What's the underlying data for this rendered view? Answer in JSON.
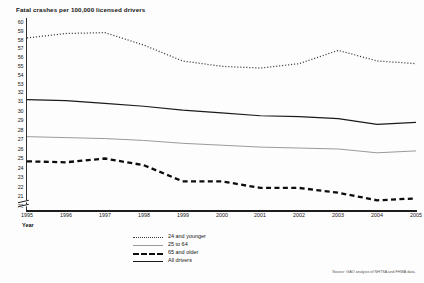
{
  "chart_data": {
    "type": "line",
    "title": "Fatal crashes per 100,000 licensed drivers",
    "xlabel": "Year",
    "ylabel": "",
    "grid": false,
    "legend_position": "bottom-center",
    "axis_note": "broken y-axis: lower band 20-32, upper band 53-60",
    "categories": [
      "1995",
      "1996",
      "1997",
      "1998",
      "1999",
      "2000",
      "2001",
      "2002",
      "2003",
      "2004",
      "2005"
    ],
    "x": [
      1995,
      1996,
      1997,
      1998,
      1999,
      2000,
      2001,
      2002,
      2003,
      2004,
      2005
    ],
    "ylim_lower": [
      20,
      32
    ],
    "ylim_upper": [
      53,
      60
    ],
    "yticks_lower": [
      "32",
      "31",
      "30",
      "29",
      "28",
      "27",
      "26",
      "25",
      "24",
      "23",
      "22",
      "21",
      "20"
    ],
    "yticks_upper": [
      "60",
      "59",
      "58",
      "57",
      "56",
      "55",
      "54",
      "53"
    ],
    "series": [
      {
        "name": "24 and younger",
        "style": "dotted",
        "color": "#3a3a3a",
        "values": [
          58.2,
          58.7,
          58.8,
          57.4,
          55.6,
          55.0,
          54.8,
          55.3,
          56.8,
          55.6,
          55.3
        ]
      },
      {
        "name": "25 to 64",
        "style": "thin-solid",
        "color": "#9a9a9a",
        "values": [
          27.3,
          27.2,
          27.1,
          26.9,
          26.6,
          26.4,
          26.2,
          26.1,
          26.0,
          25.6,
          25.8
        ]
      },
      {
        "name": "65 and older",
        "style": "bold-dashed",
        "color": "#0d0d0d",
        "values": [
          24.7,
          24.6,
          25.0,
          24.3,
          22.6,
          22.6,
          21.9,
          21.9,
          21.4,
          20.6,
          20.8
        ]
      },
      {
        "name": "All drivers",
        "style": "solid",
        "color": "#1b1b1b",
        "values": [
          31.2,
          31.1,
          30.8,
          30.5,
          30.1,
          29.8,
          29.5,
          29.4,
          29.2,
          28.6,
          28.8
        ]
      }
    ]
  },
  "legend": {
    "items": [
      {
        "label": "24 and younger"
      },
      {
        "label": "25 to 64"
      },
      {
        "label": "65 and older"
      },
      {
        "label": "All drivers"
      }
    ]
  },
  "source": {
    "text": "Source: GAO analysis of NHTSA and FHWA data."
  }
}
